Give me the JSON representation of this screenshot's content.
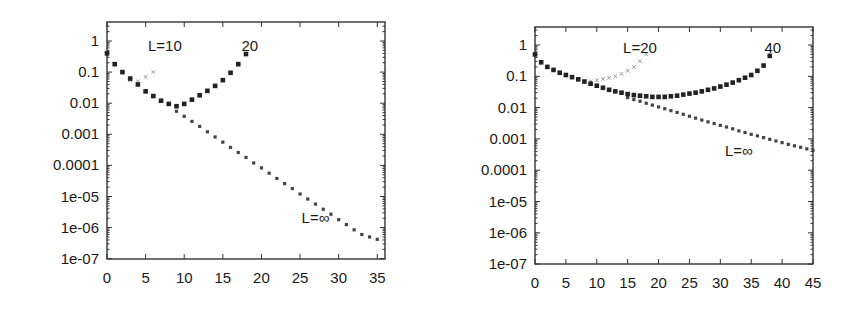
{
  "chart_data": [
    {
      "type": "scatter",
      "title": "",
      "xlabel": "",
      "ylabel": "",
      "xscale": "linear",
      "yscale": "log",
      "xlim": [
        0,
        36
      ],
      "ylim": [
        1e-07,
        3
      ],
      "grid": false,
      "legend": "none",
      "x_ticks": [
        0,
        5,
        10,
        15,
        20,
        25,
        30,
        35
      ],
      "x_tick_labels": [
        "0",
        "5",
        "10",
        "15",
        "20",
        "25",
        "30",
        "35"
      ],
      "y_ticks": [
        1,
        0.1,
        0.01,
        0.001,
        0.0001,
        1e-05,
        1e-06,
        1e-07
      ],
      "y_tick_labels": [
        "1",
        "0.1",
        "0.01",
        "0.001",
        "0.0001",
        "1e-05",
        "1e-06",
        "1e-07"
      ],
      "annotations": [
        {
          "text": "L=10",
          "x": 7.5,
          "y": 0.7
        },
        {
          "text": "20",
          "x": 18.5,
          "y": 0.7
        },
        {
          "text": "L=∞",
          "x": 27,
          "y": 2e-06
        }
      ],
      "series": [
        {
          "name": "L=10",
          "marker": "small-x-light",
          "x": [
            3,
            4,
            5,
            6
          ],
          "y": [
            0.055,
            0.05,
            0.07,
            0.1
          ]
        },
        {
          "name": "L=20",
          "marker": "square",
          "x": [
            0,
            1,
            2,
            3,
            4,
            5,
            6,
            7,
            8,
            9,
            10,
            11,
            12,
            13,
            14,
            15,
            16,
            17,
            18
          ],
          "y": [
            0.4,
            0.18,
            0.1,
            0.062,
            0.04,
            0.024,
            0.017,
            0.012,
            0.0095,
            0.008,
            0.0095,
            0.013,
            0.018,
            0.025,
            0.036,
            0.055,
            0.095,
            0.18,
            0.38
          ]
        },
        {
          "name": "L=∞",
          "marker": "plus-small",
          "x": [
            9,
            10,
            11,
            12,
            13,
            14,
            15,
            16,
            17,
            18,
            19,
            20,
            21,
            22,
            23,
            24,
            25,
            26,
            27,
            28,
            29,
            30,
            31,
            32,
            33,
            34,
            35
          ],
          "y": [
            0.0055,
            0.0038,
            0.0026,
            0.0018,
            0.0012,
            0.00082,
            0.00056,
            0.00038,
            0.00026,
            0.00018,
            0.00012,
            8.3e-05,
            5.6e-05,
            3.8e-05,
            2.6e-05,
            1.8e-05,
            1.2e-05,
            8.3e-06,
            5.7e-06,
            3.9e-06,
            2.7e-06,
            1.8e-06,
            1.25e-06,
            8.5e-07,
            6e-07,
            5e-07,
            4.2e-07
          ]
        }
      ]
    },
    {
      "type": "scatter",
      "title": "",
      "xlabel": "",
      "ylabel": "",
      "xscale": "linear",
      "yscale": "log",
      "xlim": [
        0,
        45
      ],
      "ylim": [
        1e-07,
        3
      ],
      "grid": false,
      "legend": "none",
      "x_ticks": [
        0,
        5,
        10,
        15,
        20,
        25,
        30,
        35,
        40,
        45
      ],
      "x_tick_labels": [
        "0",
        "5",
        "10",
        "15",
        "20",
        "25",
        "30",
        "35",
        "40",
        "45"
      ],
      "y_ticks": [
        1,
        0.1,
        0.01,
        0.001,
        0.0001,
        1e-05,
        1e-06,
        1e-07
      ],
      "y_tick_labels": [
        "1",
        "0.1",
        "0.01",
        "0.001",
        "0.0001",
        "1e-05",
        "1e-06",
        "1e-07"
      ],
      "annotations": [
        {
          "text": "L=20",
          "x": 17,
          "y": 0.8
        },
        {
          "text": "40",
          "x": 38.5,
          "y": 0.8
        },
        {
          "text": "L=∞",
          "x": 33,
          "y": 0.0004
        }
      ],
      "series": [
        {
          "name": "L=20",
          "marker": "small-x-light",
          "x": [
            9,
            10,
            11,
            12,
            13,
            14,
            15,
            16,
            17,
            18
          ],
          "y": [
            0.07,
            0.075,
            0.082,
            0.09,
            0.1,
            0.12,
            0.15,
            0.2,
            0.3,
            0.5
          ]
        },
        {
          "name": "L=40",
          "marker": "square",
          "x": [
            0,
            1,
            2,
            3,
            4,
            5,
            6,
            7,
            8,
            9,
            10,
            11,
            12,
            13,
            14,
            15,
            16,
            17,
            18,
            19,
            20,
            21,
            22,
            23,
            24,
            25,
            26,
            27,
            28,
            29,
            30,
            31,
            32,
            33,
            34,
            35,
            36,
            37,
            38
          ],
          "y": [
            0.5,
            0.28,
            0.2,
            0.16,
            0.13,
            0.11,
            0.094,
            0.08,
            0.068,
            0.058,
            0.05,
            0.043,
            0.037,
            0.033,
            0.03,
            0.027,
            0.025,
            0.024,
            0.023,
            0.022,
            0.022,
            0.022,
            0.023,
            0.024,
            0.026,
            0.028,
            0.03,
            0.033,
            0.037,
            0.041,
            0.047,
            0.054,
            0.063,
            0.075,
            0.09,
            0.11,
            0.15,
            0.22,
            0.45
          ]
        },
        {
          "name": "L=∞",
          "marker": "plus-small",
          "x": [
            15,
            16,
            17,
            18,
            19,
            20,
            21,
            22,
            23,
            24,
            25,
            26,
            27,
            28,
            29,
            30,
            31,
            32,
            33,
            34,
            35,
            36,
            37,
            38,
            39,
            40,
            41,
            42,
            43,
            44,
            45
          ],
          "y": [
            0.021,
            0.018,
            0.016,
            0.0138,
            0.012,
            0.0105,
            0.0092,
            0.008,
            0.007,
            0.0061,
            0.0053,
            0.0046,
            0.004,
            0.0035,
            0.0031,
            0.0027,
            0.0024,
            0.0021,
            0.0018,
            0.0016,
            0.0014,
            0.00125,
            0.0011,
            0.00097,
            0.00086,
            0.00076,
            0.00067,
            0.0006,
            0.00054,
            0.00048,
            0.00043
          ]
        }
      ]
    }
  ],
  "plots": [
    {
      "id": "left",
      "frame": {
        "x0": 107,
        "x1": 385,
        "y_top": 22,
        "y_bottom": 259
      },
      "y_decade_top_px": 41,
      "y_decade_px": 31.1,
      "x_tick_minor": 5
    },
    {
      "id": "right",
      "frame": {
        "x0": 108,
        "x1": 386,
        "y_top": 27,
        "y_bottom": 264
      },
      "y_decade_top_px": 45,
      "y_decade_px": 31.3,
      "x_tick_minor": 5
    }
  ],
  "colors": {
    "axis": "#333333",
    "text": "#1a1a1a",
    "square_marker": "#222222",
    "plus_marker": "#444444",
    "x_marker": "#999999"
  }
}
